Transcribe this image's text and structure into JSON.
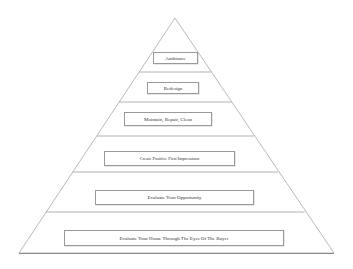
{
  "diagram": {
    "type": "pyramid",
    "levels": [
      {
        "label": "Ambiance"
      },
      {
        "label": "Redesign"
      },
      {
        "label": "Maintain, Repair, Clean"
      },
      {
        "label": "Create Positive First Impressions"
      },
      {
        "label": "Evaluate Your Opportunity"
      },
      {
        "label": "Evaluate Your Home Through The Eyes Of The Buyer"
      }
    ],
    "colors": {
      "line": "#a0a0a0",
      "box_border": "#9a9a9a",
      "text": "#333333",
      "background": "#ffffff"
    }
  }
}
